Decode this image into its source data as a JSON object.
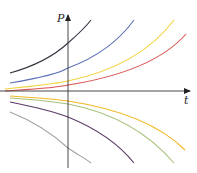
{
  "chart_data": {
    "type": "line",
    "title": "",
    "xlabel": "t",
    "ylabel": "P",
    "grid": false,
    "legend": null,
    "axis": {
      "origin_px": [
        68,
        91
      ],
      "x_axis_end_px": 190,
      "y_axis_top_px": 15,
      "y_axis_bottom_px": 168
    },
    "series": [
      {
        "name": "C4 (upper)",
        "color": "#333340",
        "path": "M10,73 C35,66 55,55 68,43 C76,36 85,28 91,20"
      },
      {
        "name": "C3 (upper)",
        "color": "#5b6fb5",
        "path": "M10,83 C40,78 60,73 68,68 C95,58 118,42 134,20"
      },
      {
        "name": "C2 (upper)",
        "color": "#f2d23c",
        "path": "M5,89 C35,86 55,84 68,81 C115,71 150,52 174,20"
      },
      {
        "name": "C1 (upper)",
        "color": "#d9534f",
        "path": "M5,91 C35,89 55,88 68,85 C125,76 165,58 186,34"
      },
      {
        "name": "-C1 (lower)",
        "color": "#f2b824",
        "path": "M10,96 C40,98 55,99 68,101 C120,109 160,125 185,150"
      },
      {
        "name": "-C2 (lower)",
        "color": "#a8c27a",
        "path": "M10,98 C40,100 55,102 68,104 C115,113 150,135 174,163"
      },
      {
        "name": "-C3 (lower)",
        "color": "#5a3c66",
        "path": "M10,102 C40,108 55,112 68,117 C95,128 118,143 134,163"
      },
      {
        "name": "-C4 (lower)",
        "color": "#a0a0a8",
        "path": "M10,112 C35,122 55,136 68,148 C76,154 85,158 91,163"
      }
    ]
  }
}
